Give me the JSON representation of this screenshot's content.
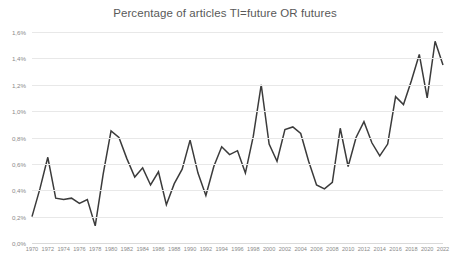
{
  "chart_data": {
    "type": "line",
    "title": "Percentage of articles TI=future OR futures",
    "xlabel": "",
    "ylabel": "",
    "ylim": [
      0.0,
      1.6
    ],
    "xlim": [
      1970,
      2022
    ],
    "grid": true,
    "legend": false,
    "y_tick_labels": [
      "0,0%",
      "0,2%",
      "0,4%",
      "0,6%",
      "0,8%",
      "1,0%",
      "1,2%",
      "1,4%",
      "1,6%"
    ],
    "y_tick_values": [
      0.0,
      0.2,
      0.4,
      0.6,
      0.8,
      1.0,
      1.2,
      1.4,
      1.6
    ],
    "x_tick_labels": [
      "1970",
      "1972",
      "1974",
      "1976",
      "1978",
      "1980",
      "1982",
      "1984",
      "1986",
      "1988",
      "1990",
      "1992",
      "1994",
      "1996",
      "1998",
      "2000",
      "2002",
      "2004",
      "2006",
      "2008",
      "2010",
      "2012",
      "2014",
      "2016",
      "2018",
      "2020",
      "2022"
    ],
    "x_tick_values": [
      1970,
      1972,
      1974,
      1976,
      1978,
      1980,
      1982,
      1984,
      1986,
      1988,
      1990,
      1992,
      1994,
      1996,
      1998,
      2000,
      2002,
      2004,
      2006,
      2008,
      2010,
      2012,
      2014,
      2016,
      2018,
      2020,
      2022
    ],
    "series_color": "#3b3b3b",
    "grid_color": "#e8e8e8",
    "x": [
      1970,
      1971,
      1972,
      1973,
      1974,
      1975,
      1976,
      1977,
      1978,
      1979,
      1980,
      1981,
      1982,
      1983,
      1984,
      1985,
      1986,
      1987,
      1988,
      1989,
      1990,
      1991,
      1992,
      1993,
      1994,
      1995,
      1996,
      1997,
      1998,
      1999,
      2000,
      2001,
      2002,
      2003,
      2004,
      2005,
      2006,
      2007,
      2008,
      2009,
      2010,
      2011,
      2012,
      2013,
      2014,
      2015,
      2016,
      2017,
      2018,
      2019,
      2020,
      2021,
      2022
    ],
    "values": [
      0.2,
      0.41,
      0.65,
      0.34,
      0.33,
      0.34,
      0.3,
      0.33,
      0.13,
      0.52,
      0.85,
      0.8,
      0.64,
      0.5,
      0.57,
      0.44,
      0.54,
      0.29,
      0.45,
      0.56,
      0.78,
      0.53,
      0.36,
      0.58,
      0.73,
      0.67,
      0.7,
      0.53,
      0.81,
      1.2,
      0.75,
      0.62,
      0.86,
      0.88,
      0.83,
      0.62,
      0.44,
      0.41,
      0.46,
      0.87,
      0.58,
      0.8,
      0.92,
      0.76,
      0.66,
      0.75,
      1.11,
      1.05,
      1.23,
      1.43,
      1.1,
      1.53,
      1.35
    ],
    "series": [
      {
        "name": "Percentage of articles TI=future OR futures",
        "values": [
          0.2,
          0.41,
          0.65,
          0.34,
          0.33,
          0.34,
          0.3,
          0.33,
          0.13,
          0.52,
          0.85,
          0.8,
          0.64,
          0.5,
          0.57,
          0.44,
          0.54,
          0.29,
          0.45,
          0.56,
          0.78,
          0.53,
          0.36,
          0.58,
          0.73,
          0.67,
          0.7,
          0.53,
          0.81,
          1.2,
          0.75,
          0.62,
          0.86,
          0.88,
          0.83,
          0.62,
          0.44,
          0.41,
          0.46,
          0.87,
          0.58,
          0.8,
          0.92,
          0.76,
          0.66,
          0.75,
          1.11,
          1.05,
          1.23,
          1.43,
          1.1,
          1.53,
          1.35
        ]
      }
    ]
  }
}
